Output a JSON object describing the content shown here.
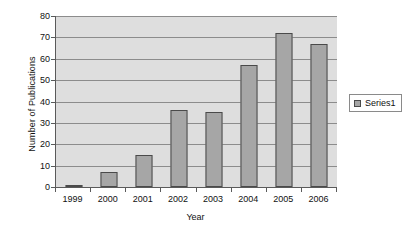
{
  "chart_data": {
    "type": "bar",
    "title": "",
    "categories": [
      "1999",
      "2000",
      "2001",
      "2002",
      "2003",
      "2004",
      "2005",
      "2006"
    ],
    "values": [
      1,
      7,
      15,
      36,
      35,
      57,
      72,
      67
    ],
    "series": [
      {
        "name": "Series1",
        "values": [
          1,
          7,
          15,
          36,
          35,
          57,
          72,
          67
        ]
      }
    ],
    "xlabel": "Year",
    "ylabel": "Number of Publications",
    "ylim": [
      0,
      80
    ],
    "ytick_step": 10,
    "yticks": [
      0,
      10,
      20,
      30,
      40,
      50,
      60,
      70,
      80
    ],
    "ytick_labels": [
      "0",
      "10",
      "20",
      "30",
      "40",
      "50",
      "60",
      "70",
      "80"
    ],
    "grid": true,
    "grid_axis": "y",
    "legend": {
      "position": "right",
      "entries": [
        "Series1"
      ]
    },
    "colors": {
      "bar_fill": "#a6a6a6",
      "bar_border": "#4a4a4a",
      "plot_background": "#dedede",
      "gridline": "#8c8c8c",
      "axis_line": "#5a5a5a",
      "text": "#111111",
      "page_background": "#ffffff"
    }
  }
}
